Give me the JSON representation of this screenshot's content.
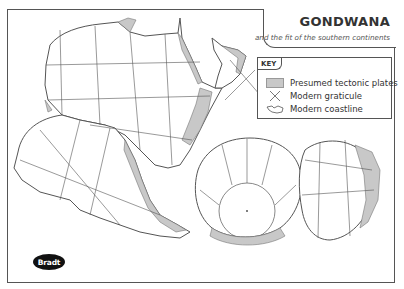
{
  "title": {
    "main": "GONDWANA",
    "subtitle": "and the fit of the southern continents"
  },
  "key": {
    "heading": "KEY",
    "items": [
      {
        "symbol": "grey-fill-swatch",
        "label": "Presumed tectonic plates"
      },
      {
        "symbol": "cross-lines",
        "label": "Modern graticule"
      },
      {
        "symbol": "coastline-outline",
        "label": "Modern coastline"
      }
    ]
  },
  "logo": {
    "text": "Bradt"
  },
  "colors": {
    "plate_fill": "#c8c8c8",
    "line": "#555555",
    "land": "#ffffff",
    "background": "#ffffff"
  },
  "continents": [
    "Africa",
    "South America",
    "Antarctica",
    "Australia",
    "India",
    "Madagascar",
    "Arabia"
  ]
}
